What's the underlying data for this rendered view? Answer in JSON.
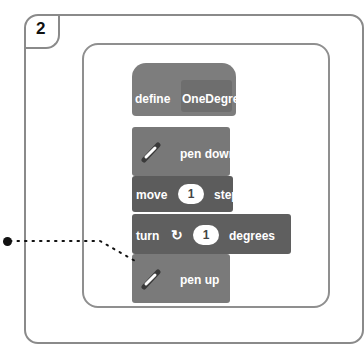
{
  "step_number": "2",
  "blocks": {
    "define": {
      "keyword": "define",
      "name": "OneDegree"
    },
    "pen_down": {
      "label": "pen down",
      "icon": "pen-icon"
    },
    "move": {
      "prefix": "move",
      "value": "1",
      "suffix": "steps"
    },
    "turn": {
      "prefix": "turn",
      "icon": "rotate-clockwise-icon",
      "value": "1",
      "suffix": "degrees"
    },
    "pen_up": {
      "label": "pen up",
      "icon": "pen-icon"
    }
  },
  "colors": {
    "block_dark": "#5c5c5c",
    "block_light": "#7d7d7d",
    "border": "#8a8a8a"
  }
}
